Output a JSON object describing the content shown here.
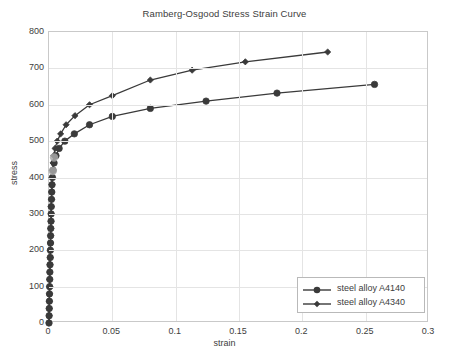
{
  "chart_data": {
    "type": "line",
    "title": "Ramberg-Osgood Stress Strain Curve",
    "xlabel": "strain",
    "ylabel": "stress",
    "xlim": [
      0,
      0.3
    ],
    "ylim": [
      0,
      800
    ],
    "xticks": [
      "0",
      "0.05",
      "0.1",
      "0.15",
      "0.2",
      "0.25",
      "0.3"
    ],
    "xtick_values": [
      0,
      0.05,
      0.1,
      0.15,
      0.2,
      0.25,
      0.3
    ],
    "yticks": [
      "0",
      "100",
      "200",
      "300",
      "400",
      "500",
      "600",
      "700",
      "800"
    ],
    "ytick_values": [
      0,
      100,
      200,
      300,
      400,
      500,
      600,
      700,
      800
    ],
    "grid": true,
    "legend_position": "lower right",
    "series": [
      {
        "name": "steel alloy A4140",
        "marker": "circle",
        "color": "#3a3a3a",
        "points": [
          [
            0.0,
            0
          ],
          [
            0.0001,
            20
          ],
          [
            0.0002,
            40
          ],
          [
            0.0003,
            60
          ],
          [
            0.0004,
            80
          ],
          [
            0.0005,
            100
          ],
          [
            0.0006,
            120
          ],
          [
            0.0007,
            140
          ],
          [
            0.0008,
            160
          ],
          [
            0.001,
            180
          ],
          [
            0.0011,
            200
          ],
          [
            0.0012,
            220
          ],
          [
            0.0013,
            240
          ],
          [
            0.0014,
            260
          ],
          [
            0.0016,
            280
          ],
          [
            0.0017,
            300
          ],
          [
            0.0018,
            320
          ],
          [
            0.002,
            340
          ],
          [
            0.0022,
            360
          ],
          [
            0.0024,
            380
          ],
          [
            0.0027,
            400
          ],
          [
            0.0032,
            420
          ],
          [
            0.004,
            440
          ],
          [
            0.0055,
            460
          ],
          [
            0.008,
            480
          ],
          [
            0.0125,
            500
          ],
          [
            0.02,
            520
          ],
          [
            0.032,
            545
          ],
          [
            0.05,
            568
          ],
          [
            0.08,
            590
          ],
          [
            0.124,
            610
          ],
          [
            0.18,
            632
          ],
          [
            0.257,
            656
          ]
        ]
      },
      {
        "name": "steel alloy A4340",
        "marker": "diamond",
        "color": "#3a3a3a",
        "points": [
          [
            0.0,
            0
          ],
          [
            0.0001,
            20
          ],
          [
            0.0002,
            40
          ],
          [
            0.0003,
            60
          ],
          [
            0.0004,
            80
          ],
          [
            0.0005,
            100
          ],
          [
            0.0006,
            120
          ],
          [
            0.0007,
            140
          ],
          [
            0.0008,
            160
          ],
          [
            0.001,
            180
          ],
          [
            0.0011,
            200
          ],
          [
            0.0012,
            220
          ],
          [
            0.0013,
            240
          ],
          [
            0.0014,
            260
          ],
          [
            0.0016,
            280
          ],
          [
            0.0017,
            300
          ],
          [
            0.0018,
            320
          ],
          [
            0.002,
            340
          ],
          [
            0.0021,
            360
          ],
          [
            0.0023,
            380
          ],
          [
            0.0025,
            400
          ],
          [
            0.0028,
            420
          ],
          [
            0.0032,
            440
          ],
          [
            0.0038,
            460
          ],
          [
            0.0048,
            480
          ],
          [
            0.0065,
            500
          ],
          [
            0.0092,
            520
          ],
          [
            0.0135,
            545
          ],
          [
            0.0205,
            570
          ],
          [
            0.032,
            600
          ],
          [
            0.05,
            625
          ],
          [
            0.08,
            668
          ],
          [
            0.113,
            695
          ],
          [
            0.155,
            718
          ],
          [
            0.22,
            745
          ]
        ]
      }
    ],
    "highlighted_points": [
      {
        "x": 0.004,
        "y": 455,
        "color": "#a8a8a8"
      },
      {
        "x": 0.003,
        "y": 418,
        "color": "#a8a8a8"
      }
    ]
  },
  "legend": {
    "entries": [
      {
        "label": "steel alloy A4140",
        "marker": "circle"
      },
      {
        "label": "steel alloy A4340",
        "marker": "diamond"
      }
    ]
  }
}
